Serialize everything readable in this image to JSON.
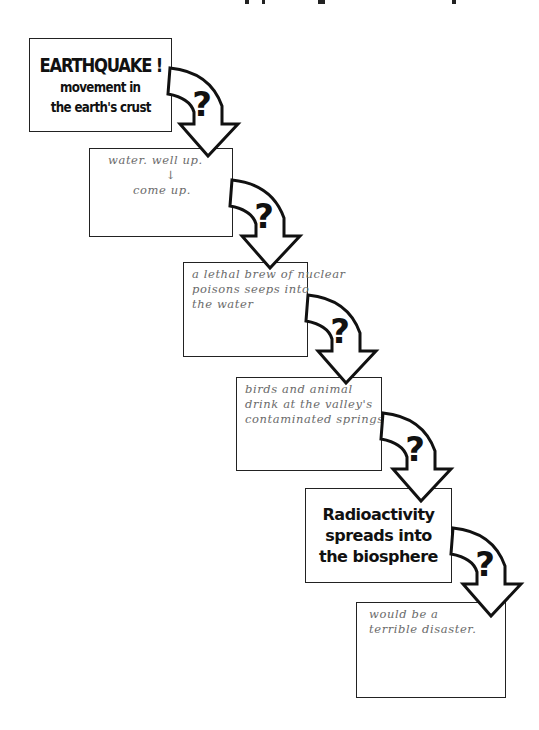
{
  "diagram": {
    "type": "flow-chain",
    "direction": "top-left to bottom-right",
    "connector": {
      "icon": "curved-arrow-with-question-mark",
      "glyph": "?"
    },
    "steps": [
      {
        "style": "printed",
        "title": "EARTHQUAKE !",
        "lines": [
          "movement in",
          "the earth's crust"
        ]
      },
      {
        "style": "handwritten",
        "lines": [
          "water. well up.",
          "↓",
          "come up."
        ]
      },
      {
        "style": "handwritten",
        "lines": [
          "a lethal brew of nuclear",
          "poisons seeps into",
          "the water"
        ]
      },
      {
        "style": "handwritten",
        "lines": [
          "birds and animal",
          "drink at the valley's",
          "contaminated springs."
        ]
      },
      {
        "style": "printed",
        "lines": [
          "Radioactivity",
          "spreads into",
          "the biosphere"
        ]
      },
      {
        "style": "handwritten",
        "lines": [
          "would be a",
          "terrible disaster."
        ]
      }
    ]
  },
  "colors": {
    "ink": "#111111",
    "pencil": "#6a6a6a",
    "paper": "#ffffff"
  }
}
